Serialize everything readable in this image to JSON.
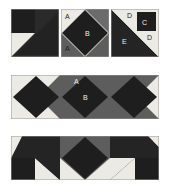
{
  "figure": {
    "kind": "quilt-block-construction-diagram",
    "width": 170,
    "height": 192,
    "background": "#ffffff"
  },
  "palette": {
    "dark": "#1e1e1e",
    "mid_gray": "#5d5d5d",
    "light": "#eceae5",
    "block_bg": "#f4f2ee",
    "border": "#9a9691"
  },
  "labels": {
    "A": "A",
    "B": "B",
    "C": "C",
    "D": "D",
    "E": "E"
  },
  "units": [
    {
      "id": "unit-1",
      "name": "corner-triangle-unit",
      "row": 1,
      "col": 1,
      "x": 11,
      "y": 9,
      "w": 48,
      "h": 48,
      "patches": [
        {
          "name": "dark-square-top-left",
          "color": "dark"
        },
        {
          "name": "light-square-bottom-left",
          "color": "light"
        },
        {
          "name": "light-triangle-top-right",
          "color": "light"
        },
        {
          "name": "dark-large-triangle",
          "color": "dark"
        }
      ],
      "labels": []
    },
    {
      "id": "unit-2",
      "name": "square-in-a-square-unit",
      "row": 1,
      "col": 2,
      "x": 61,
      "y": 9,
      "w": 48,
      "h": 48,
      "patches": [
        {
          "name": "corner-triangle-A",
          "color": "light"
        },
        {
          "name": "corner-triangle-A-gray",
          "color": "mid_gray"
        },
        {
          "name": "center-diamond-B",
          "color": "dark"
        }
      ],
      "labels": [
        {
          "text": "A",
          "tone": "dark",
          "x": 4,
          "y": 4
        },
        {
          "text": "B",
          "tone": "light",
          "x": 24,
          "y": 21
        },
        {
          "text": "A",
          "tone": "dark",
          "x": 4,
          "y": 36
        }
      ]
    },
    {
      "id": "unit-3",
      "name": "diagonal-corner-unit",
      "row": 1,
      "col": 3,
      "x": 111,
      "y": 9,
      "w": 48,
      "h": 48,
      "patches": [
        {
          "name": "large-triangle-E",
          "color": "dark"
        },
        {
          "name": "narrow-light-strip",
          "color": "light"
        },
        {
          "name": "corner-square-C",
          "color": "dark"
        },
        {
          "name": "small-triangle-D-top",
          "color": "light"
        },
        {
          "name": "small-triangle-D-right",
          "color": "light"
        }
      ],
      "labels": [
        {
          "text": "D",
          "tone": "dark",
          "x": 16,
          "y": 3
        },
        {
          "text": "C",
          "tone": "light",
          "x": 31,
          "y": 11
        },
        {
          "text": "E",
          "tone": "light",
          "x": 12,
          "y": 29
        },
        {
          "text": "D",
          "tone": "dark",
          "x": 36,
          "y": 26
        }
      ]
    }
  ],
  "strips": [
    {
      "id": "strip-1",
      "name": "middle-row-strip",
      "row": 2,
      "x": 11,
      "y": 75,
      "w": 148,
      "h": 44,
      "segments": [
        {
          "name": "square-in-square-left",
          "bg": "light",
          "corner_right": "mid_gray"
        },
        {
          "name": "square-in-square-center",
          "bg": "mid_gray",
          "labeled": true
        },
        {
          "name": "square-in-square-right",
          "bg": "mid_gray",
          "corner_right": "light"
        }
      ],
      "labels": [
        {
          "text": "A",
          "tone": "light",
          "x": 63,
          "y": 3
        },
        {
          "text": "B",
          "tone": "light",
          "x": 72,
          "y": 19
        }
      ]
    },
    {
      "id": "strip-2",
      "name": "bottom-row-strip",
      "row": 3,
      "x": 11,
      "y": 136,
      "w": 148,
      "h": 44,
      "segments": [
        {
          "name": "corner-triangle-unit-mirrored-left"
        },
        {
          "name": "diamond-unit-center"
        },
        {
          "name": "corner-triangle-unit-right"
        }
      ],
      "labels": []
    }
  ]
}
